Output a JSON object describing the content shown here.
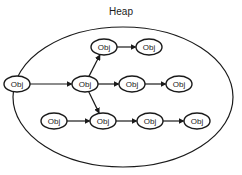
{
  "title": "Heap",
  "heap": {
    "cx": 123,
    "cy": 97,
    "rx": 110,
    "ry": 70
  },
  "node_style": {
    "rx": 13,
    "ry": 8,
    "stroke": "#1a1a1a",
    "fill": "#ffffff"
  },
  "nodes": [
    {
      "id": "n1",
      "label": "Obj",
      "x": 104,
      "y": 47
    },
    {
      "id": "n2",
      "label": "Obj",
      "x": 149,
      "y": 47
    },
    {
      "id": "n3",
      "label": "Obj",
      "x": 17,
      "y": 84
    },
    {
      "id": "n4",
      "label": "Obj",
      "x": 85,
      "y": 84
    },
    {
      "id": "n5",
      "label": "Obj",
      "x": 132,
      "y": 84
    },
    {
      "id": "n6",
      "label": "Obj",
      "x": 179,
      "y": 84
    },
    {
      "id": "n7",
      "label": "Obj",
      "x": 54,
      "y": 121
    },
    {
      "id": "n8",
      "label": "Obj",
      "x": 103,
      "y": 121
    },
    {
      "id": "n9",
      "label": "Obj",
      "x": 150,
      "y": 121
    },
    {
      "id": "n10",
      "label": "Obj",
      "x": 197,
      "y": 121
    }
  ],
  "edges": [
    {
      "from": "n1",
      "to": "n2"
    },
    {
      "from": "n3",
      "to": "n4"
    },
    {
      "from": "n4",
      "to": "n1"
    },
    {
      "from": "n4",
      "to": "n5"
    },
    {
      "from": "n5",
      "to": "n6"
    },
    {
      "from": "n4",
      "to": "n8"
    },
    {
      "from": "n7",
      "to": "n8"
    },
    {
      "from": "n8",
      "to": "n9"
    },
    {
      "from": "n9",
      "to": "n10"
    }
  ]
}
